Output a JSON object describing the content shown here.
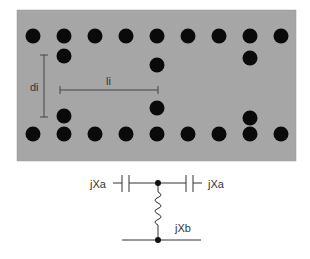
{
  "waveguide": {
    "background_color": "#a6a6a6",
    "post_color": "#0a0a0a",
    "rect": {
      "x": 17,
      "y": 10,
      "w": 279,
      "h": 151
    },
    "post_radius": 7.5,
    "top_row": {
      "y": 36,
      "xs": [
        33,
        64,
        95,
        126,
        157,
        188,
        219,
        250,
        281
      ]
    },
    "bottom_row": {
      "y": 134,
      "xs": [
        33,
        64,
        95,
        126,
        157,
        188,
        219,
        250,
        281
      ]
    },
    "inner_posts": [
      {
        "x": 64,
        "y": 56
      },
      {
        "x": 64,
        "y": 116
      },
      {
        "x": 157,
        "y": 65
      },
      {
        "x": 157,
        "y": 108
      },
      {
        "x": 250,
        "y": 58
      },
      {
        "x": 250,
        "y": 118
      }
    ],
    "dimension_di": {
      "label": "di",
      "x": 44,
      "y1": 55,
      "y2": 117
    },
    "dimension_li": {
      "label": "li",
      "y": 90,
      "x1": 60,
      "x2": 158
    }
  },
  "circuit": {
    "left_reactance_label": "jXa",
    "right_reactance_label": "jXa",
    "shunt_reactance_label": "jXb",
    "line_color": "#333333"
  }
}
